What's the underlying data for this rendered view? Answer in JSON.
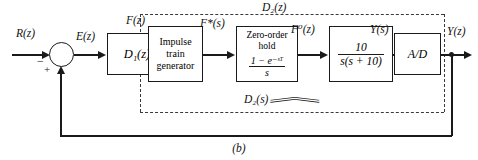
{
  "figure": {
    "caption": "(b)",
    "signals": {
      "input": "R(z)",
      "error": "E(z)",
      "controller_out": "F(z)",
      "impulse_out": "F*(s)",
      "hold_out": "F⁰(z)",
      "plant_out": "Y(s)",
      "output": "Y(z)"
    },
    "sum_junction": {
      "name": "summing-junction",
      "plus_sign": "+",
      "minus_sign": "−"
    },
    "blocks": [
      {
        "id": "controller",
        "label": "D₁(z)",
        "italic": true
      },
      {
        "id": "impulse-train-generator",
        "line1": "Impulse",
        "line2": "train",
        "line3": "generator"
      },
      {
        "id": "zero-order-hold",
        "line1": "Zero-order",
        "line2": "hold",
        "numerator": "1 − e⁻ˢᵀ",
        "denominator": "s"
      },
      {
        "id": "plant",
        "numerator": "10",
        "denominator": "s(s + 10)"
      },
      {
        "id": "ad-converter",
        "label": "A/D"
      }
    ],
    "group_labels": {
      "outer_dashed": "D₂(z)",
      "inner_brace": "D₂(s)"
    }
  }
}
